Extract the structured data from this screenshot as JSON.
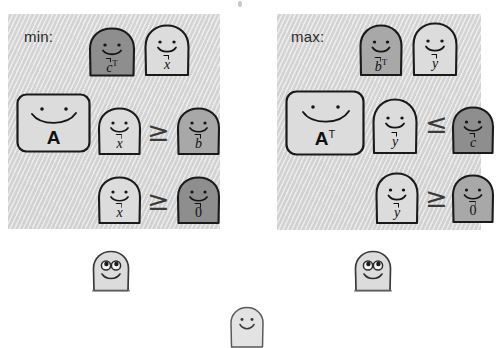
{
  "figure": {
    "title_text": "",
    "background_color": "#ffffff",
    "panel_fill": "#d4d4d4"
  },
  "panels": [
    {
      "id": "min",
      "label": "min:",
      "objective": {
        "terms": [
          {
            "symbol": "c",
            "vector": true,
            "transpose": true,
            "shade": "dark"
          },
          {
            "symbol": "x",
            "vector": true,
            "transpose": false,
            "shade": "light"
          }
        ]
      },
      "constraint": {
        "matrix": {
          "symbol": "A",
          "transpose": false,
          "shade": "light"
        },
        "variable": {
          "symbol": "x",
          "vector": true,
          "shade": "light"
        },
        "relation": "≥",
        "rhs": {
          "symbol": "b",
          "vector": true,
          "shade": "medium"
        }
      },
      "nonnegativity": {
        "variable": {
          "symbol": "x",
          "vector": true,
          "shade": "light"
        },
        "relation": "≥",
        "rhs": {
          "symbol": "0",
          "vector": true,
          "shade": "dark"
        }
      }
    },
    {
      "id": "max",
      "label": "max:",
      "objective": {
        "terms": [
          {
            "symbol": "b",
            "vector": true,
            "transpose": true,
            "shade": "medium"
          },
          {
            "symbol": "y",
            "vector": true,
            "transpose": false,
            "shade": "light"
          }
        ]
      },
      "constraint": {
        "matrix": {
          "symbol": "A",
          "transpose": true,
          "shade": "light"
        },
        "variable": {
          "symbol": "y",
          "vector": true,
          "shade": "light"
        },
        "relation": "≤",
        "rhs": {
          "symbol": "c",
          "vector": true,
          "shade": "dark"
        }
      },
      "nonnegativity": {
        "variable": {
          "symbol": "y",
          "vector": true,
          "shade": "light"
        },
        "relation": "≥",
        "rhs": {
          "symbol": "0",
          "vector": true,
          "shade": "medium"
        }
      }
    }
  ],
  "loose_characters": [
    {
      "id": "left-watcher",
      "face": "big-eyes-smile",
      "shade": "light",
      "label": ""
    },
    {
      "id": "right-watcher",
      "face": "big-eyes-smile",
      "shade": "light",
      "label": ""
    },
    {
      "id": "bottom-watcher",
      "face": "dot-eyes-smile",
      "shade": "light",
      "label": ""
    }
  ],
  "transpose_mark": "T",
  "relations": {
    "geq": "≥",
    "leq": "≤"
  },
  "shades": {
    "light": "#dcdcdc",
    "medium": "#a8a8a8",
    "dark": "#8e8e8e",
    "outline": "#1a1a1a"
  }
}
